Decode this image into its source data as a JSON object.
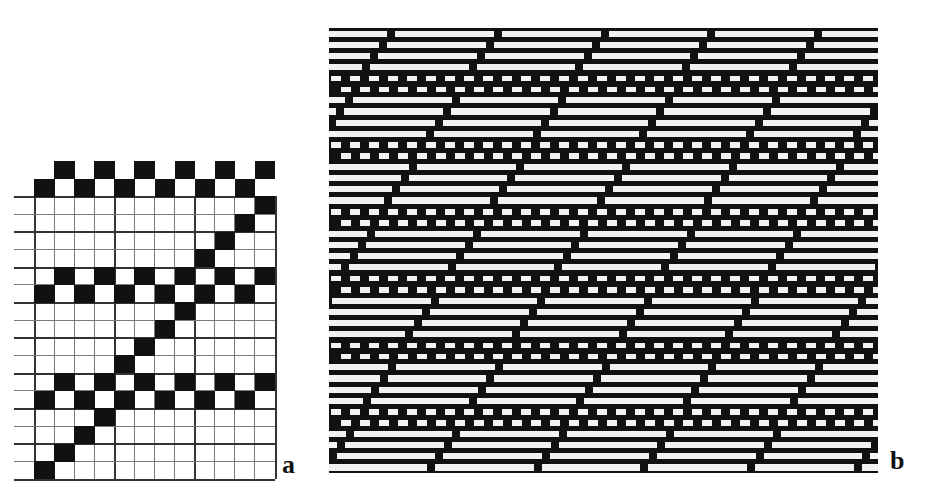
{
  "figure": {
    "panels": [
      {
        "id": "a",
        "label": "a",
        "type": "weave-draft-grid",
        "columns": 12,
        "rows": 18,
        "filled_color": "#111111",
        "cells_by_row": [
          [
            1,
            3,
            5,
            7,
            9,
            11
          ],
          [
            0,
            2,
            4,
            6,
            8,
            10
          ],
          [
            11
          ],
          [
            10
          ],
          [
            9
          ],
          [
            8
          ],
          [
            1,
            3,
            5,
            7,
            9,
            11
          ],
          [
            0,
            2,
            4,
            6,
            8,
            10
          ],
          [
            7
          ],
          [
            6
          ],
          [
            5
          ],
          [
            4
          ],
          [
            1,
            3,
            5,
            7,
            9,
            11
          ],
          [
            0,
            2,
            4,
            6,
            8,
            10
          ],
          [
            3
          ],
          [
            2
          ],
          [
            1
          ],
          [
            0
          ]
        ]
      },
      {
        "id": "b",
        "label": "b",
        "type": "fabric-simulation",
        "background_color": "#111111",
        "thread_color": "#f2f2f2",
        "row_sequence": [
          "float",
          "float",
          "float",
          "float",
          "plain-a",
          "plain-b",
          "float",
          "float",
          "float",
          "float",
          "plain-a",
          "plain-b",
          "float",
          "float",
          "float",
          "float",
          "plain-a",
          "plain-b",
          "float",
          "float",
          "float",
          "float",
          "plain-a",
          "plain-b",
          "float",
          "float",
          "float",
          "float",
          "plain-a",
          "plain-b",
          "float",
          "float",
          "float",
          "float",
          "plain-a",
          "plain-b",
          "float",
          "float",
          "float",
          "float"
        ],
        "float_repeat_px": 106.7,
        "float_gap_px": 8,
        "diagonal_shift_px_per_row": 8.5,
        "plain_square_period_px": 19,
        "plain_square_width_px": 10
      }
    ]
  }
}
